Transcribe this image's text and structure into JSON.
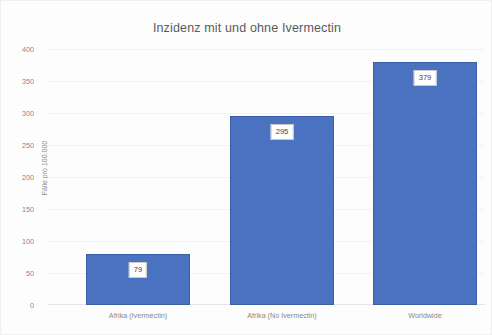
{
  "chart_data": {
    "type": "bar",
    "title": "Inzidenz mit und ohne Ivermectin",
    "xlabel": "",
    "ylabel": "Fälle pro 100.000",
    "categories": [
      "Afrika (Ivermectin)",
      "Afrika (No Ivermectin)",
      "Worldwide"
    ],
    "values": [
      79,
      295,
      379
    ],
    "data_labels": [
      "79",
      "295",
      "379"
    ],
    "ylim": [
      0,
      400
    ],
    "yticks": [
      0,
      50,
      100,
      150,
      200,
      250,
      300,
      350,
      400
    ],
    "ytick_labels": [
      "0",
      "50",
      "100",
      "150",
      "200",
      "250",
      "300",
      "350",
      "400"
    ],
    "grid": true,
    "legend": false,
    "legend_position": "none",
    "series": [
      {
        "name": "Inzidenz",
        "values": [
          79,
          295,
          379
        ],
        "color": "#4a72c0"
      }
    ]
  },
  "style": {
    "bar_color": "#4a72c0",
    "bar_border_color": "#3a5fa8",
    "gridline_color": "#f2f2f2",
    "axis_color": "#e4e4e4",
    "title_color": "#5a5a5a",
    "tick_color": "#888888",
    "label_box_background": "#ffffff",
    "label_box_border": "#c9c9c9",
    "background": "#fdfdfd"
  }
}
